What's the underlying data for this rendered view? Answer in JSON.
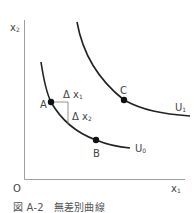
{
  "diagram": {
    "axes": {
      "y_label": "x",
      "y_label_sub": "2",
      "x_label": "x",
      "x_label_sub": "1",
      "origin_label": "O"
    },
    "curves": [
      {
        "name": "U",
        "sub": "0"
      },
      {
        "name": "U",
        "sub": "1"
      }
    ],
    "points": {
      "A": "A",
      "B": "B",
      "C": "C"
    },
    "deltas": {
      "dx1": "Δ x",
      "dx1_sub": "1",
      "dx2": "Δ x",
      "dx2_sub": "2"
    },
    "colors": {
      "axis": "#9a9a9a",
      "curve": "#222222",
      "text": "#444444"
    }
  },
  "caption": {
    "number": "図 A-2",
    "title": "無差別曲線"
  }
}
